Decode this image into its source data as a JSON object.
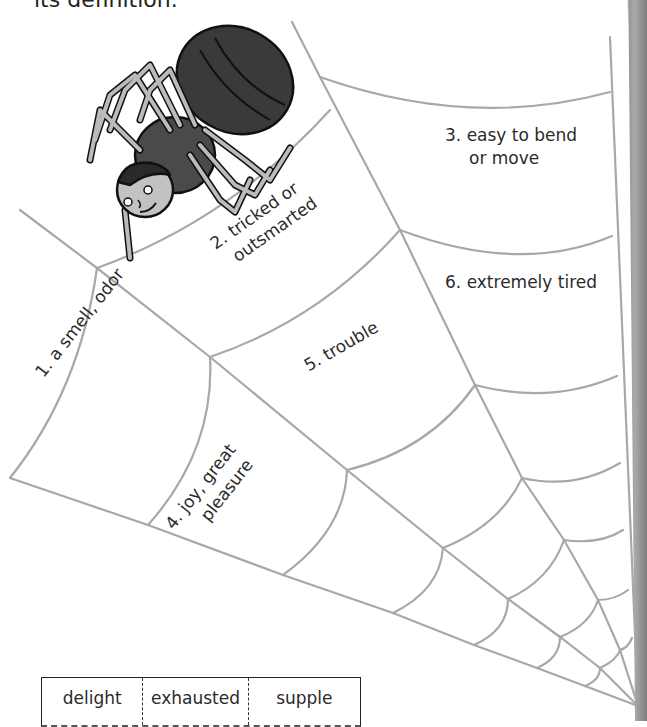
{
  "page": {
    "instruction_clipped": "its definition."
  },
  "clues": [
    {
      "number": "1.",
      "text": "a smell, odor"
    },
    {
      "number": "2.",
      "text": "tricked or",
      "text2": "outsmarted"
    },
    {
      "number": "3.",
      "text": "easy to bend",
      "text2": "or move"
    },
    {
      "number": "4.",
      "text": "joy, great",
      "text2": "pleasure"
    },
    {
      "number": "5.",
      "text": "trouble"
    },
    {
      "number": "6.",
      "text": "extremely tired"
    }
  ],
  "word_bank": {
    "words": [
      "delight",
      "exhausted",
      "supple"
    ]
  },
  "illustration": {
    "subject": "cartoon spider with human face hanging on web"
  },
  "colors": {
    "web_strand": "#a8a8a8",
    "spider_body": "#3a3a3a",
    "spider_legs": "#b5b5b5",
    "text": "#2b2b2b"
  }
}
